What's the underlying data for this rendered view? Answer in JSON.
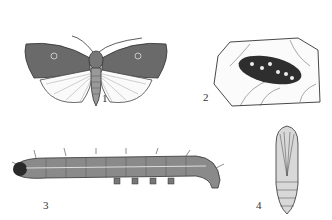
{
  "figures": [
    {
      "id": 1,
      "label": "1",
      "subject": "adult moth"
    },
    {
      "id": 2,
      "label": "2",
      "subject": "egg mass on leaf"
    },
    {
      "id": 3,
      "label": "3",
      "subject": "larva"
    },
    {
      "id": 4,
      "label": "4",
      "subject": "pupa"
    }
  ],
  "colors": {
    "ink": "#2a2a2a",
    "dark_wing": "#555555",
    "paper": "#ffffff"
  }
}
